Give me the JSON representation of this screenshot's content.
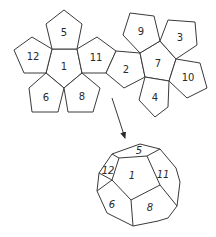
{
  "colors": {
    "stroke": "#3a3a3a",
    "fill": "#ffffff",
    "text": "#2a2a2a"
  },
  "net": {
    "faces": [
      {
        "label": "1",
        "points": "52,49 77,49 82,73 64,88 46,73",
        "lx": 64,
        "ly": 66
      },
      {
        "label": "5",
        "points": "64,10 82,24 77,49 52,49 46,24",
        "lx": 64,
        "ly": 32
      },
      {
        "label": "12",
        "points": "52,49 46,73 24,73 14,50 32,37",
        "lx": 33,
        "ly": 56
      },
      {
        "label": "6",
        "points": "46,73 64,88 58,112 32,112 29,88",
        "lx": 46,
        "ly": 97
      },
      {
        "label": "8",
        "points": "64,88 82,73 100,88 93,112 68,112",
        "lx": 82,
        "ly": 96
      },
      {
        "label": "11",
        "points": "77,49 97,37 116,51 106,73 82,73",
        "lx": 96,
        "ly": 57
      },
      {
        "label": "2",
        "points": "116,51 140,53 145,77 124,88 106,73",
        "lx": 126,
        "ly": 69
      },
      {
        "label": "7",
        "points": "140,53 160,41 176,59 169,81 145,77",
        "lx": 158,
        "ly": 63
      },
      {
        "label": "9",
        "points": "130,13 154,16 160,41 140,53 123,35",
        "lx": 141,
        "ly": 31
      },
      {
        "label": "3",
        "points": "160,41 168,20 195,22 197,45 176,59",
        "lx": 180,
        "ly": 37
      },
      {
        "label": "10",
        "points": "176,59 200,63 207,88 187,98 169,81",
        "lx": 188,
        "ly": 77
      },
      {
        "label": "4",
        "points": "145,77 169,81 168,107 155,117 139,100",
        "lx": 155,
        "ly": 97
      }
    ]
  },
  "arrow": {
    "x1": 112,
    "y1": 98,
    "x2": 125,
    "y2": 138
  },
  "solid": {
    "outline": "112,154 140,144 160,149 176,168 180,182 177,206 168,218 158,221 133,226 107,213 97,191 99,173",
    "edges": [
      "112,154 119,158",
      "160,149 147,156",
      "119,158 147,156",
      "119,158 112,180",
      "147,156 160,185",
      "112,180 131,200",
      "160,185 131,200",
      "112,180 97,191",
      "160,185 177,206",
      "131,200 133,226",
      "99,173 112,180"
    ],
    "faces": [
      {
        "label": "5",
        "lx": 139,
        "ly": 150
      },
      {
        "label": "12",
        "lx": 108,
        "ly": 170
      },
      {
        "label": "1",
        "lx": 132,
        "ly": 175
      },
      {
        "label": "11",
        "lx": 163,
        "ly": 174
      },
      {
        "label": "6",
        "lx": 112,
        "ly": 204
      },
      {
        "label": "8",
        "lx": 150,
        "ly": 207
      }
    ]
  }
}
